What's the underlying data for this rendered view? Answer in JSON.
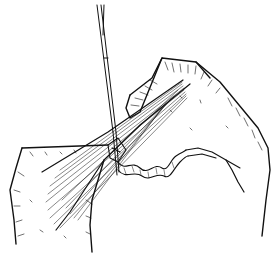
{
  "illustration": {
    "subject": "Line drawing of a surgical procedure: a needle/probe inserted into a fibrous tissue bundle held between two hands, with a wavy tissue strand",
    "style": "black ink line drawing on white background",
    "colors": {
      "ink": "#111111",
      "background": "#ffffff"
    }
  }
}
